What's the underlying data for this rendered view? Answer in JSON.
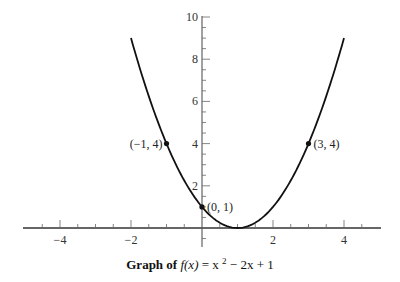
{
  "chart_data": {
    "type": "line",
    "title": {
      "prefix": "Graph of",
      "func": "f(x)",
      "eq": " = x",
      "sup": "2",
      "rest": " − 2x + 1"
    },
    "function": {
      "a": 1,
      "b": -2,
      "c": 1
    },
    "x_range_curve": [
      -2,
      4
    ],
    "xlim": [
      -5,
      5
    ],
    "ylim": [
      -0.9,
      10
    ],
    "x_ticks_major": [
      -4,
      -2,
      2,
      4
    ],
    "x_tick_labels": [
      "−4",
      "−2",
      "2",
      "4"
    ],
    "x_ticks_minor_step": 0.5,
    "y_ticks_major": [
      2,
      4,
      6,
      8,
      10
    ],
    "y_tick_labels": [
      "2",
      "4",
      "6",
      "8",
      "10"
    ],
    "y_ticks_minor_step": 0.5,
    "points": [
      {
        "x": -1,
        "y": 4,
        "label": "(−1, 4)",
        "side": "left"
      },
      {
        "x": 0,
        "y": 1,
        "label": "(0, 1)",
        "side": "right"
      },
      {
        "x": 3,
        "y": 4,
        "label": "(3, 4)",
        "side": "right"
      }
    ],
    "xlabel": "",
    "ylabel": "",
    "grid": false
  }
}
